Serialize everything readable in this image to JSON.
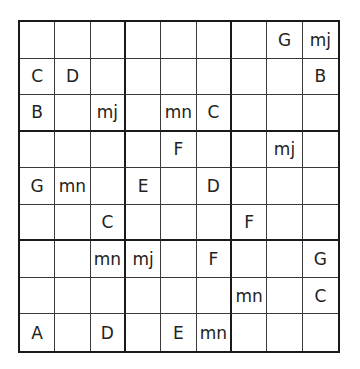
{
  "puzzle": {
    "type": "letter-sudoku",
    "size": 9,
    "symbols": [
      "A",
      "B",
      "C",
      "D",
      "E",
      "F",
      "G",
      "mj",
      "mn"
    ],
    "grid": [
      [
        "",
        "",
        "",
        "",
        "",
        "",
        "",
        "G",
        "mj"
      ],
      [
        "C",
        "D",
        "",
        "",
        "",
        "",
        "",
        "",
        "B"
      ],
      [
        "B",
        "",
        "mj",
        "",
        "mn",
        "C",
        "",
        "",
        ""
      ],
      [
        "",
        "",
        "",
        "",
        "F",
        "",
        "",
        "mj",
        ""
      ],
      [
        "G",
        "mn",
        "",
        "E",
        "",
        "D",
        "",
        "",
        ""
      ],
      [
        "",
        "",
        "C",
        "",
        "",
        "",
        "F",
        "",
        ""
      ],
      [
        "",
        "",
        "mn",
        "mj",
        "",
        "F",
        "",
        "",
        "G"
      ],
      [
        "",
        "",
        "",
        "",
        "",
        "",
        "mn",
        "",
        "C"
      ],
      [
        "A",
        "",
        "D",
        "",
        "E",
        "mn",
        "",
        "",
        ""
      ]
    ]
  }
}
